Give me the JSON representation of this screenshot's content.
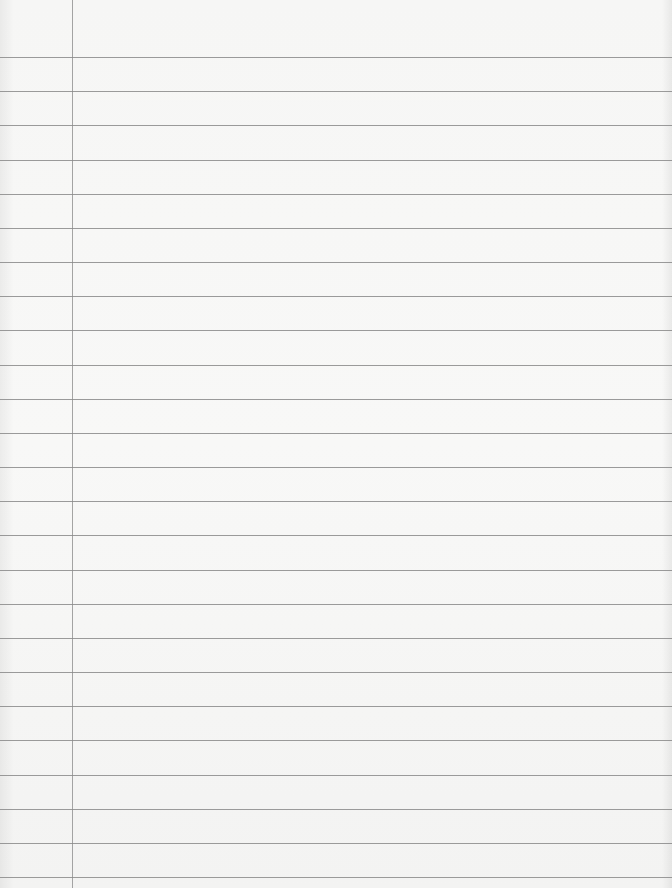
{
  "sheet": {
    "description": "Blank lined notebook paper",
    "paper_color": "#f6f6f5",
    "rule_color": "#8a8a8a",
    "margin_line_color": "#9a9a9a",
    "margin_line_x": 72,
    "rules": {
      "count": 25,
      "first_y": 57,
      "spacing": 34.17
    },
    "text": ""
  }
}
